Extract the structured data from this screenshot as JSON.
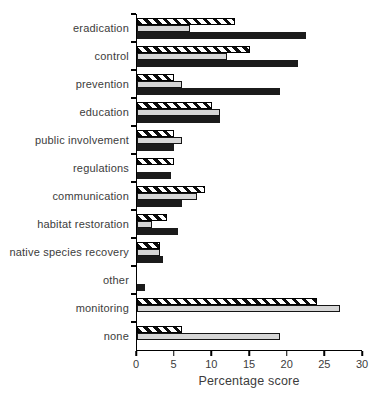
{
  "chart_data": {
    "type": "bar",
    "orientation": "horizontal",
    "title": "",
    "xlabel": "Percentage score",
    "ylabel": "",
    "xlim": [
      0,
      30
    ],
    "xticks": [
      0,
      5,
      10,
      15,
      20,
      25,
      30
    ],
    "grid": false,
    "legend_position": "none",
    "categories": [
      "eradication",
      "control",
      "prevention",
      "education",
      "public involvement",
      "regulations",
      "communication",
      "habitat restoration",
      "native species recovery",
      "other",
      "monitoring",
      "none"
    ],
    "series": [
      {
        "name": "striped",
        "style": "black-white-diagonal-hatch",
        "values": [
          13,
          15,
          5,
          10,
          5,
          5,
          9,
          4,
          3,
          0,
          24,
          6
        ]
      },
      {
        "name": "gray",
        "color": "#d6d6d6",
        "values": [
          7,
          12,
          6,
          11,
          6,
          0,
          8,
          2,
          3,
          0,
          27,
          19
        ]
      },
      {
        "name": "black",
        "color": "#1b1b1b",
        "values": [
          22.5,
          21.5,
          19,
          11,
          5,
          4.5,
          6,
          5.5,
          3.5,
          1,
          0,
          0
        ]
      }
    ]
  }
}
